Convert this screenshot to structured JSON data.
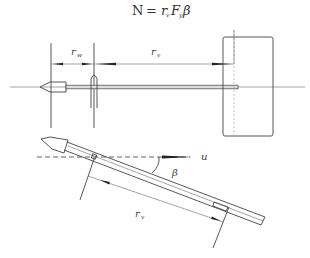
{
  "formula": {
    "lhs": "N",
    "eq": "=",
    "r": "r",
    "r_sub": "v",
    "F": "F",
    "F_sub": "y",
    "beta": "β"
  },
  "top_view": {
    "label_rw": "r",
    "label_rw_sub": "w",
    "label_rv": "r",
    "label_rv_sub": "v"
  },
  "bottom_view": {
    "label_u": "u",
    "label_beta": "β",
    "label_rv": "r",
    "label_rv_sub": "v"
  }
}
